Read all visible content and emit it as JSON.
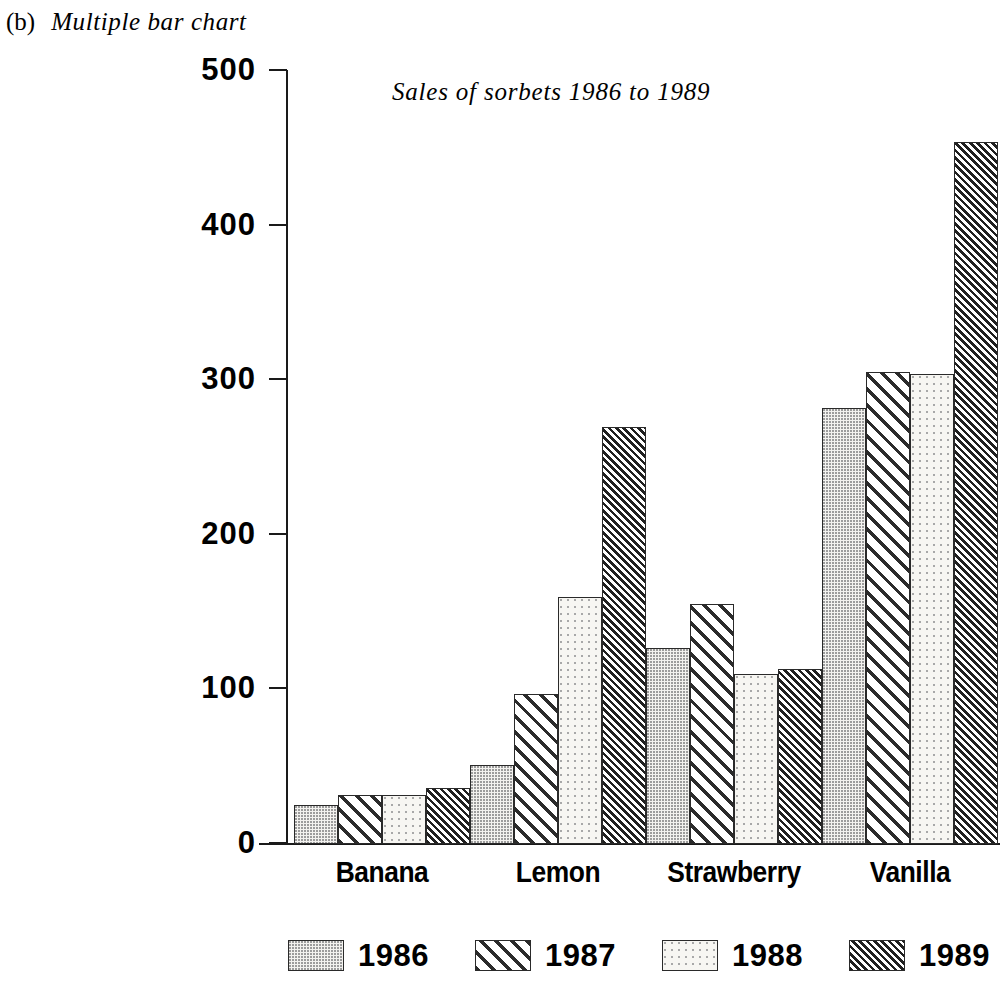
{
  "figure": {
    "index": "(b)",
    "caption": "Multiple bar chart"
  },
  "chart_data": {
    "type": "bar",
    "title": "Sales of sorbets 1986 to 1989",
    "xlabel": "",
    "ylabel": "",
    "ylim": [
      0,
      500
    ],
    "yticks": [
      0,
      100,
      200,
      300,
      400,
      500
    ],
    "ytick_labels": [
      "0",
      "100",
      "200",
      "300",
      "400",
      "500"
    ],
    "grid": false,
    "legend_position": "bottom",
    "categories": [
      "Banana",
      "Lemon",
      "Strawberry",
      "Vanilla"
    ],
    "series": [
      {
        "name": "1986",
        "values": [
          25,
          51,
          127,
          282
        ],
        "pattern": "fine-stipple",
        "color": "#f3f2ef"
      },
      {
        "name": "1987",
        "values": [
          32,
          97,
          155,
          305
        ],
        "pattern": "diagonal-hatch",
        "color": "#2b2b2b"
      },
      {
        "name": "1988",
        "values": [
          32,
          160,
          110,
          304
        ],
        "pattern": "sparse-dots",
        "color": "#f7f6f2"
      },
      {
        "name": "1989",
        "values": [
          36,
          270,
          113,
          454
        ],
        "pattern": "dense-diagonal-hatch",
        "color": "#202020"
      }
    ]
  },
  "legend": {
    "items": [
      {
        "label": "1986",
        "pattern": "pat-1986"
      },
      {
        "label": "1987",
        "pattern": "pat-1987"
      },
      {
        "label": "1988",
        "pattern": "pat-1988"
      },
      {
        "label": "1989",
        "pattern": "pat-1989"
      }
    ]
  }
}
